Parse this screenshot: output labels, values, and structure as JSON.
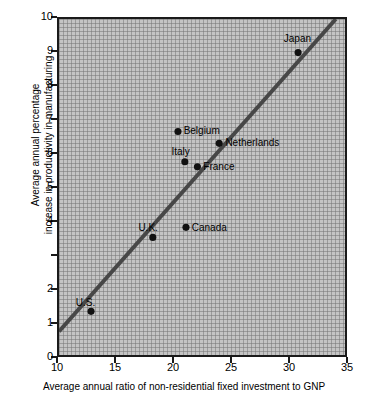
{
  "chart_data": {
    "type": "scatter",
    "title": "",
    "xlabel": "Average annual ratio of non-residential fixed investment to GNP",
    "ylabel_line1": "Average annual percentage",
    "ylabel_line2": "increase in productivity in manufacturing",
    "xlim": [
      10,
      35
    ],
    "ylim": [
      0,
      10
    ],
    "xticks": [
      10,
      15,
      20,
      25,
      30,
      35
    ],
    "xtick_labels": [
      "10",
      "15",
      "20",
      "25",
      "30",
      "35"
    ],
    "yticks": [
      0,
      1,
      2,
      3,
      4,
      5,
      6,
      7,
      8,
      9,
      10
    ],
    "ytick_labels": [
      "0",
      "1",
      "2",
      "",
      "4",
      "5",
      "6",
      "7",
      "8",
      "9",
      "10"
    ],
    "grid": true,
    "grid_style": "fine graph-paper mesh",
    "legend": "none",
    "points": [
      {
        "label": "U.S.",
        "x": 12.8,
        "y": 1.3,
        "label_pos": "above-left"
      },
      {
        "label": "U.K.",
        "x": 18.2,
        "y": 3.5,
        "label_pos": "above-left"
      },
      {
        "label": "Canada",
        "x": 21.1,
        "y": 3.8,
        "label_pos": "right"
      },
      {
        "label": "Italy",
        "x": 21.0,
        "y": 5.75,
        "label_pos": "above-left"
      },
      {
        "label": "France",
        "x": 22.1,
        "y": 5.6,
        "label_pos": "right"
      },
      {
        "label": "Belgium",
        "x": 20.4,
        "y": 6.65,
        "label_pos": "right"
      },
      {
        "label": "Netherlands",
        "x": 24.0,
        "y": 6.3,
        "label_pos": "right"
      },
      {
        "label": "Japan",
        "x": 30.9,
        "y": 9.0,
        "label_pos": "above"
      }
    ],
    "trendline": {
      "name": "regression line",
      "x0": 10.0,
      "y0": 0.7,
      "x1": 34.2,
      "y1": 10.0
    }
  },
  "colors": {
    "plot_background": "#c4c4c4",
    "grid_line": "#787878",
    "axis": "#1a1a1a",
    "marker": "#111111",
    "trendline": "#474747",
    "page_background": "#ffffff",
    "text": "#000000"
  }
}
